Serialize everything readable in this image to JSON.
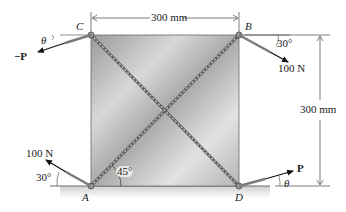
{
  "diagram": {
    "type": "statics-free-body-plate",
    "plate": {
      "corners": {
        "top_left": "C",
        "top_right": "B",
        "bottom_left": "A",
        "bottom_right": "D"
      },
      "width_label": "300 mm",
      "height_label": "300 mm",
      "diagonals": [
        "A-B",
        "C-D"
      ],
      "diagonal_angle_label": "45°"
    },
    "forces": [
      {
        "at": "C",
        "label": "−P",
        "angle_label": "θ",
        "direction": "down-left"
      },
      {
        "at": "B",
        "label": "100 N",
        "angle_label": "30°",
        "direction": "down-right"
      },
      {
        "at": "A",
        "label": "100 N",
        "angle_label": "30°",
        "direction": "up-left"
      },
      {
        "at": "D",
        "label": "P",
        "angle_label": "θ",
        "direction": "up-right"
      }
    ],
    "colors": {
      "plate_light": "#e6e6e6",
      "plate_dark": "#8c8c8c",
      "cable": "#7a7a7a",
      "arrow": "#111111",
      "dimension": "#444444"
    }
  }
}
